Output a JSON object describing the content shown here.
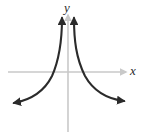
{
  "figure": {
    "kind": "cartesian-graph",
    "background_color": "#ffffff",
    "axis_color": "#c9c9c9",
    "curve_color": "#2b2b2b",
    "axes": {
      "x_label": "x",
      "y_label": "y",
      "origin": {
        "x": 68,
        "y": 72
      },
      "x_axis": {
        "start_x": 8,
        "end_x": 127,
        "y": 72,
        "arrow": "right"
      },
      "y_axis": {
        "x": 68,
        "start_y": 132,
        "end_y": 14,
        "arrow": "up"
      }
    },
    "curve": {
      "description": "even rational function with vertical asymptote at x = 0 and horizontal asymptote y = 0",
      "vertical_asymptote": "x = 0",
      "horizontal_asymptote": "y = 0",
      "branches": [
        {
          "name": "left-branch",
          "quadrant": "II",
          "arrow_ends": [
            "top",
            "left"
          ],
          "path": "M 62 18 C 62 40, 60 58, 52 76 C 44 92, 30 100, 14 103"
        },
        {
          "name": "right-branch",
          "quadrant": "I",
          "arrow_ends": [
            "top",
            "right"
          ],
          "path": "M 74 18 C 74 40, 76 58, 85 76 C 94 92, 108 99, 124 101"
        }
      ]
    }
  },
  "chart_data": {
    "type": "line",
    "title": "",
    "xlabel": "x",
    "ylabel": "y",
    "grid": false,
    "legend": false,
    "series": [
      {
        "name": "left-branch",
        "x": [
          -6.0,
          -4.0,
          -3.0,
          -2.0,
          -1.5,
          -1.0,
          -0.7,
          -0.5,
          -0.35,
          -0.25
        ],
        "y": [
          0.03,
          0.06,
          0.11,
          0.25,
          0.44,
          1.0,
          2.04,
          4.0,
          8.16,
          16.0
        ]
      },
      {
        "name": "right-branch",
        "x": [
          0.25,
          0.35,
          0.5,
          0.7,
          1.0,
          1.5,
          2.0,
          3.0,
          4.0,
          6.0
        ],
        "y": [
          16.0,
          8.16,
          4.0,
          2.04,
          1.0,
          0.44,
          0.25,
          0.11,
          0.06,
          0.03
        ]
      }
    ]
  }
}
